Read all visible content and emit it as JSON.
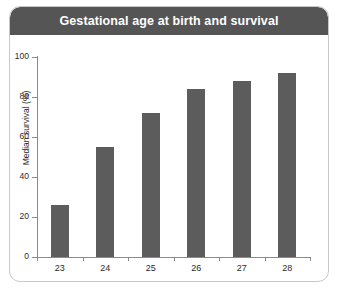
{
  "card": {
    "header_title": "Gestational age at birth and survival",
    "header_color": "#555555",
    "border_color": "#c9c9c9",
    "background_color": "#ffffff"
  },
  "chart_data": {
    "type": "bar",
    "title": "Gestational age at birth and survival",
    "xlabel": "Gestational age (weeks)",
    "ylabel": "Median survival (%)",
    "categories": [
      "23",
      "24",
      "25",
      "26",
      "27",
      "28"
    ],
    "values": [
      26,
      55,
      72,
      84,
      88,
      92
    ],
    "ylim": [
      0,
      100
    ],
    "yticks": [
      "0",
      "20",
      "40",
      "60",
      "80",
      "100"
    ],
    "ytick_values": [
      0,
      20,
      40,
      60,
      80,
      100
    ],
    "grid": false,
    "legend": false,
    "bar_color": "#5c5c5c",
    "axis_color": "#8a8a8a"
  }
}
